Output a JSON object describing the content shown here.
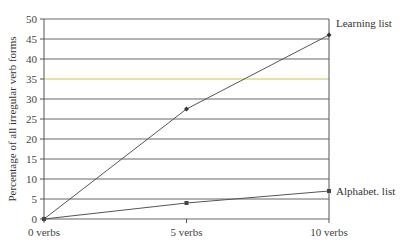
{
  "chart_data": {
    "type": "line",
    "title": "",
    "xlabel": "",
    "ylabel": "Percentage of all irregular verb forms",
    "categories": [
      "0 verbs",
      "5 verbs",
      "10 verbs"
    ],
    "x": [
      0,
      5,
      10
    ],
    "series": [
      {
        "name": "Learning list",
        "values": [
          0,
          27.5,
          46
        ],
        "marker": "diamond"
      },
      {
        "name": "Alphabet. list",
        "values": [
          0,
          4,
          7
        ],
        "marker": "square"
      }
    ],
    "ylim": [
      0,
      50
    ],
    "yticks": [
      0,
      5,
      10,
      15,
      20,
      25,
      30,
      35,
      40,
      45,
      50
    ],
    "grid": true,
    "legend_position": "inline-right",
    "colors": {
      "line": "#555555",
      "grid": "#666666",
      "highlight_grid": "#c8c850"
    }
  }
}
